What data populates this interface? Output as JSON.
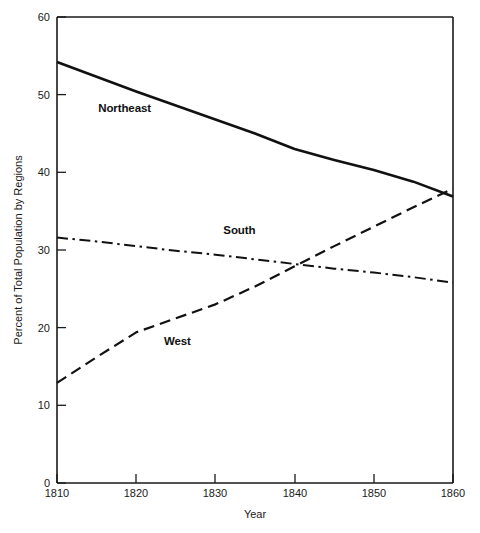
{
  "chart_data": {
    "type": "line",
    "title": "",
    "xlabel": "Year",
    "ylabel": "Percent of Total Population by Regions",
    "xlim": [
      1810,
      1860
    ],
    "ylim": [
      0,
      60
    ],
    "grid": false,
    "legend": "inline-labels",
    "xticks": [
      "1810",
      "1820",
      "1830",
      "1840",
      "1850",
      "1860"
    ],
    "yticks": [
      "0",
      "10",
      "20",
      "30",
      "40",
      "50",
      "60"
    ],
    "x": [
      1810,
      1815,
      1820,
      1825,
      1830,
      1835,
      1840,
      1845,
      1850,
      1855,
      1860
    ],
    "series": [
      {
        "name": "Northeast",
        "style": "solid",
        "label": "Northeast",
        "values": [
          54.2,
          52.3,
          50.4,
          48.6,
          46.8,
          45.0,
          43.0,
          41.6,
          40.3,
          38.8,
          36.9
        ]
      },
      {
        "name": "South",
        "style": "dash-dot",
        "label": "South",
        "values": [
          31.6,
          31.1,
          30.5,
          29.9,
          29.4,
          28.8,
          28.2,
          27.6,
          27.1,
          26.5,
          25.8
        ]
      },
      {
        "name": "West",
        "style": "dashed",
        "label": "West",
        "values": [
          12.9,
          16.2,
          19.4,
          21.2,
          23.0,
          25.3,
          27.9,
          30.5,
          33.0,
          35.5,
          37.9
        ]
      }
    ],
    "annotations": [
      {
        "text": "Northeast",
        "x": 1815.2,
        "y": 47.8
      },
      {
        "text": "South",
        "x": 1831.0,
        "y": 32.0
      },
      {
        "text": "West",
        "x": 1823.5,
        "y": 17.8
      }
    ]
  },
  "axis": {
    "x_title": "Year",
    "y_title": "Percent of Total Population by Regions"
  }
}
